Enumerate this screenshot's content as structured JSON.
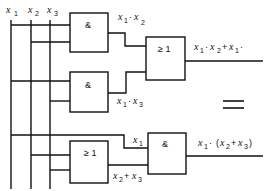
{
  "inputs": {
    "x1": {
      "var": "x",
      "sub": "1"
    },
    "x2": {
      "var": "x",
      "sub": "2"
    },
    "x3": {
      "var": "x",
      "sub": "3"
    }
  },
  "gates": {
    "and1": {
      "symbol": "&"
    },
    "and2": {
      "symbol": "&"
    },
    "or1": {
      "symbol": "≥ 1"
    },
    "or2": {
      "symbol": "≥ 1"
    },
    "and3": {
      "symbol": "&"
    }
  },
  "labels": {
    "and1_out": "x₁ · x₂",
    "and2_out": "x₁ · x₃",
    "or1_out": "x₁ · x₂ + x₁ ·",
    "bottom_x1": "x₁",
    "or2_out": "x₂ + x₃",
    "and3_out": "x₁ · (x₂ + x₃)"
  },
  "equivalence_symbol": "="
}
